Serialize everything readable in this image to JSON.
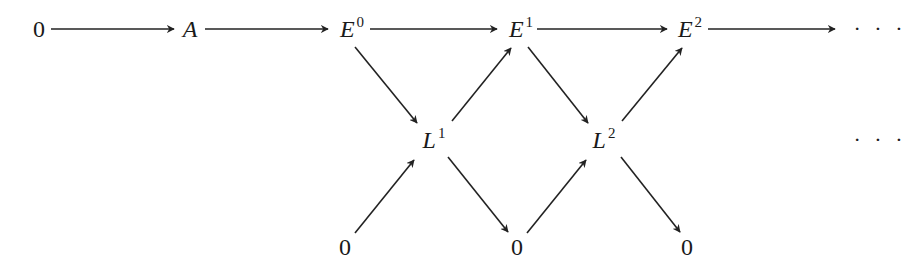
{
  "diagram": {
    "type": "commutative-diagram",
    "nodes": {
      "zero_left": {
        "base": "0",
        "sup": "",
        "x": 39,
        "y": 29
      },
      "A": {
        "base": "A",
        "sup": "",
        "x": 190,
        "y": 29
      },
      "E0": {
        "base": "E",
        "sup": "0",
        "x": 352,
        "y": 29
      },
      "E1": {
        "base": "E",
        "sup": "1",
        "x": 521,
        "y": 29
      },
      "E2": {
        "base": "E",
        "sup": "2",
        "x": 690,
        "y": 29
      },
      "dots_top": {
        "base": "· · ·",
        "sup": "",
        "x": 880,
        "y": 29
      },
      "L1": {
        "base": "L",
        "sup": "1",
        "x": 434,
        "y": 140
      },
      "L2": {
        "base": "L",
        "sup": "2",
        "x": 604,
        "y": 140
      },
      "dots_mid": {
        "base": "· · ·",
        "sup": "",
        "x": 880,
        "y": 140
      },
      "zero_b1": {
        "base": "0",
        "sup": "",
        "x": 345,
        "y": 247
      },
      "zero_b2": {
        "base": "0",
        "sup": "",
        "x": 517,
        "y": 247
      },
      "zero_b3": {
        "base": "0",
        "sup": "",
        "x": 687,
        "y": 247
      }
    },
    "edges": [
      {
        "from": "0",
        "to": "A",
        "x1": 51,
        "y1": 29,
        "x2": 174,
        "y2": 29
      },
      {
        "from": "A",
        "to": "E^0",
        "x1": 205,
        "y1": 29,
        "x2": 328,
        "y2": 29
      },
      {
        "from": "E^0",
        "to": "E^1",
        "x1": 370,
        "y1": 29,
        "x2": 497,
        "y2": 29
      },
      {
        "from": "E^1",
        "to": "E^2",
        "x1": 537,
        "y1": 29,
        "x2": 667,
        "y2": 29
      },
      {
        "from": "E^2",
        "to": "...",
        "x1": 708,
        "y1": 29,
        "x2": 835,
        "y2": 29
      },
      {
        "from": "E^0",
        "to": "L^1",
        "x1": 355,
        "y1": 47,
        "x2": 417,
        "y2": 123
      },
      {
        "from": "L^1",
        "to": "E^1",
        "x1": 452,
        "y1": 121,
        "x2": 511,
        "y2": 48
      },
      {
        "from": "E^1",
        "to": "L^2",
        "x1": 528,
        "y1": 47,
        "x2": 588,
        "y2": 123
      },
      {
        "from": "L^2",
        "to": "E^2",
        "x1": 622,
        "y1": 121,
        "x2": 682,
        "y2": 48
      },
      {
        "from": "0",
        "to": "L^1",
        "x1": 355,
        "y1": 233,
        "x2": 414,
        "y2": 160
      },
      {
        "from": "L^1",
        "to": "0",
        "x1": 448,
        "y1": 157,
        "x2": 508,
        "y2": 232
      },
      {
        "from": "0",
        "to": "L^2",
        "x1": 527,
        "y1": 233,
        "x2": 586,
        "y2": 160
      },
      {
        "from": "L^2",
        "to": "0",
        "x1": 621,
        "y1": 157,
        "x2": 680,
        "y2": 232
      }
    ],
    "stroke_color": "#222222"
  }
}
